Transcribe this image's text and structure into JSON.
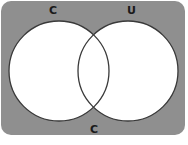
{
  "diagram": {
    "type": "venn",
    "background_color": "#8f8f8f",
    "circle_fill": "#ffffff",
    "circle_stroke": "#3a3a3a",
    "sets": [
      {
        "label": "C"
      },
      {
        "label": "U"
      }
    ],
    "bottom_label": "C"
  }
}
